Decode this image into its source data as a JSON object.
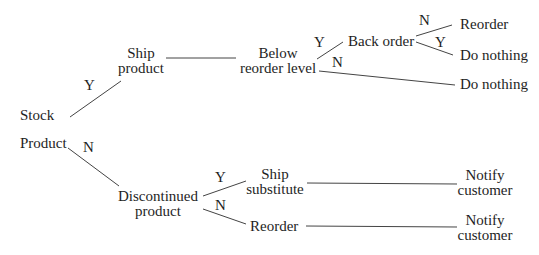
{
  "diagram": {
    "type": "decision-tree",
    "root": {
      "line1": "Stock",
      "line2": "Product"
    },
    "nodes": {
      "ship_product": {
        "line1": "Ship",
        "line2": "product"
      },
      "below_reorder": {
        "line1": "Below",
        "line2": "reorder level"
      },
      "back_order": {
        "label": "Back order"
      },
      "reorder_top": {
        "label": "Reorder"
      },
      "do_nothing_1": {
        "label": "Do nothing"
      },
      "do_nothing_2": {
        "label": "Do nothing"
      },
      "discontinued": {
        "line1": "Discontinued",
        "line2": "product"
      },
      "ship_substitute": {
        "line1": "Ship",
        "line2": "substitute"
      },
      "reorder_bottom": {
        "label": "Reorder"
      },
      "notify_1": {
        "line1": "Notify",
        "line2": "customer"
      },
      "notify_2": {
        "line1": "Notify",
        "line2": "customer"
      }
    },
    "edge_labels": {
      "stock_yes": "Y",
      "product_no": "N",
      "below_yes": "Y",
      "below_no": "N",
      "back_no": "N",
      "back_yes": "Y",
      "disc_yes": "Y",
      "disc_no": "N"
    },
    "edges": [
      {
        "from": "Stock Product",
        "to": "Ship product",
        "label": "Y"
      },
      {
        "from": "Stock Product",
        "to": "Discontinued product",
        "label": "N"
      },
      {
        "from": "Ship product",
        "to": "Below reorder level",
        "label": ""
      },
      {
        "from": "Below reorder level",
        "to": "Back order",
        "label": "Y"
      },
      {
        "from": "Below reorder level",
        "to": "Do nothing",
        "label": "N"
      },
      {
        "from": "Back order",
        "to": "Reorder",
        "label": "N"
      },
      {
        "from": "Back order",
        "to": "Do nothing",
        "label": "Y"
      },
      {
        "from": "Discontinued product",
        "to": "Ship substitute",
        "label": "Y"
      },
      {
        "from": "Discontinued product",
        "to": "Reorder",
        "label": "N"
      },
      {
        "from": "Ship substitute",
        "to": "Notify customer",
        "label": ""
      },
      {
        "from": "Reorder",
        "to": "Notify customer",
        "label": ""
      }
    ]
  }
}
